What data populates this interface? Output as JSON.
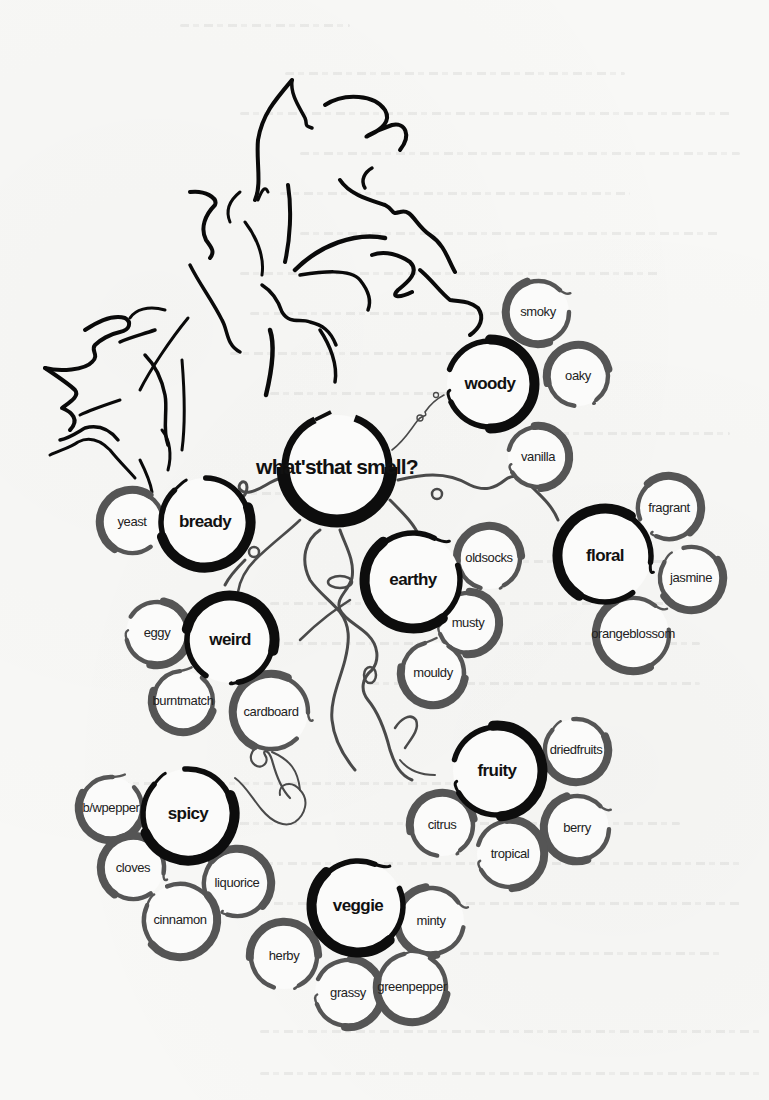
{
  "diagram": {
    "title_lines": [
      "what's",
      "that smell?"
    ],
    "colors": {
      "background": "#f8f8f6",
      "category_ring": "#0d0d0d",
      "descriptor_ring": "#555555",
      "vine": "#4a4a4a",
      "leaf_outline": "#0a0a0a",
      "text": "#111111"
    },
    "hub": {
      "label_lines": [
        "what's",
        "that smell?"
      ],
      "x": 337,
      "y": 467,
      "r": 56
    },
    "categories": [
      {
        "id": "woody",
        "label": "woody",
        "x": 490,
        "y": 384,
        "r": 46,
        "descriptors": [
          {
            "label_lines": [
              "smoky"
            ],
            "x": 538,
            "y": 312,
            "r": 34
          },
          {
            "label_lines": [
              "oaky"
            ],
            "x": 578,
            "y": 376,
            "r": 33
          },
          {
            "label_lines": [
              "vanilla"
            ],
            "x": 538,
            "y": 457,
            "r": 33
          }
        ]
      },
      {
        "id": "bready",
        "label": "bready",
        "x": 205,
        "y": 522,
        "r": 47,
        "descriptors": [
          {
            "label_lines": [
              "yeast"
            ],
            "x": 132,
            "y": 522,
            "r": 34
          }
        ]
      },
      {
        "id": "earthy",
        "label": "earthy",
        "x": 413,
        "y": 580,
        "r": 50,
        "descriptors": [
          {
            "label_lines": [
              "old",
              "socks"
            ],
            "x": 489,
            "y": 558,
            "r": 34
          },
          {
            "label_lines": [
              "musty"
            ],
            "x": 468,
            "y": 623,
            "r": 33
          },
          {
            "label_lines": [
              "mouldy"
            ],
            "x": 433,
            "y": 673,
            "r": 34
          }
        ]
      },
      {
        "id": "floral",
        "label": "floral",
        "x": 605,
        "y": 556,
        "r": 49,
        "descriptors": [
          {
            "label_lines": [
              "fragrant"
            ],
            "x": 669,
            "y": 508,
            "r": 34
          },
          {
            "label_lines": [
              "jasmine"
            ],
            "x": 691,
            "y": 578,
            "r": 34
          },
          {
            "label_lines": [
              "orange",
              "blossom"
            ],
            "x": 633,
            "y": 634,
            "r": 39
          }
        ]
      },
      {
        "id": "weird",
        "label": "weird",
        "x": 230,
        "y": 640,
        "r": 46,
        "descriptors": [
          {
            "label_lines": [
              "eggy"
            ],
            "x": 157,
            "y": 633,
            "r": 34
          },
          {
            "label_lines": [
              "burnt",
              "match"
            ],
            "x": 183,
            "y": 701,
            "r": 33
          },
          {
            "label_lines": [
              "cardboard"
            ],
            "x": 271,
            "y": 712,
            "r": 40
          }
        ]
      },
      {
        "id": "fruity",
        "label": "fruity",
        "x": 497,
        "y": 771,
        "r": 47,
        "descriptors": [
          {
            "label_lines": [
              "dried",
              "fruits"
            ],
            "x": 576,
            "y": 750,
            "r": 34
          },
          {
            "label_lines": [
              "berry"
            ],
            "x": 577,
            "y": 828,
            "r": 35
          },
          {
            "label_lines": [
              "citrus"
            ],
            "x": 442,
            "y": 825,
            "r": 34
          },
          {
            "label_lines": [
              "tropical"
            ],
            "x": 510,
            "y": 854,
            "r": 36
          }
        ]
      },
      {
        "id": "spicy",
        "label": "spicy",
        "x": 188,
        "y": 814,
        "r": 48,
        "descriptors": [
          {
            "label_lines": [
              "b/w",
              "pepper"
            ],
            "x": 111,
            "y": 808,
            "r": 34
          },
          {
            "label_lines": [
              "cloves"
            ],
            "x": 133,
            "y": 868,
            "r": 34
          },
          {
            "label_lines": [
              "liquorice"
            ],
            "x": 237,
            "y": 883,
            "r": 36
          },
          {
            "label_lines": [
              "cinnamon"
            ],
            "x": 180,
            "y": 920,
            "r": 39
          }
        ]
      },
      {
        "id": "veggie",
        "label": "veggie",
        "x": 358,
        "y": 906,
        "r": 48,
        "descriptors": [
          {
            "label_lines": [
              "minty"
            ],
            "x": 431,
            "y": 921,
            "r": 36
          },
          {
            "label_lines": [
              "herby"
            ],
            "x": 284,
            "y": 956,
            "r": 36
          },
          {
            "label_lines": [
              "grassy"
            ],
            "x": 348,
            "y": 993,
            "r": 36
          },
          {
            "label_lines": [
              "green",
              "pepper"
            ],
            "x": 412,
            "y": 987,
            "r": 37
          }
        ]
      }
    ]
  }
}
